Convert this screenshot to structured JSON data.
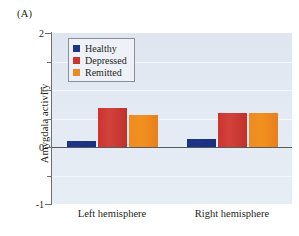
{
  "figure": {
    "panel_label": "(A)"
  },
  "chart_data": {
    "type": "bar",
    "title": "",
    "xlabel": "",
    "ylabel": "Amygdala activity",
    "categories": [
      "Left hemisphere",
      "Right hemisphere"
    ],
    "series": [
      {
        "name": "Healthy",
        "color": "#1c3589",
        "values": [
          0.1,
          0.14
        ]
      },
      {
        "name": "Depressed",
        "color": "#cc3430",
        "values": [
          0.68,
          0.59
        ]
      },
      {
        "name": "Remitted",
        "color": "#ef8a22",
        "values": [
          0.56,
          0.6
        ]
      }
    ],
    "ylim": [
      -1,
      2
    ],
    "ytick_labels": [
      "2",
      "1",
      "0",
      "-1"
    ],
    "ytick_values": [
      2,
      1,
      0,
      -1
    ],
    "yminor_values": [
      1.5,
      0.5,
      -0.5
    ],
    "grid": true,
    "grid_color": "#f4f8fc",
    "zero_line": 0,
    "zero_line_color": "#58595b",
    "plot_background": "#e2e9f2",
    "legend_position": "top-left"
  }
}
